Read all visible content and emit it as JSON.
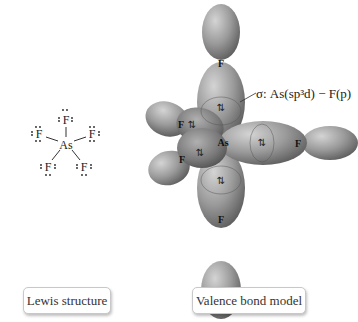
{
  "lewis": {
    "center_atom": "As",
    "ligands": [
      "F",
      "F",
      "F",
      "F",
      "F"
    ],
    "caption": "Lewis structure"
  },
  "valence_bond": {
    "center_atom": "As",
    "ligand_label": "F",
    "bond_annotation": "σ: As(sp³d) − F(p)",
    "electron_pair_symbol": "⇅",
    "caption": "Valence bond model",
    "colors": {
      "lobe_fill": "#8a8a8a",
      "lobe_highlight": "#c4c4c4",
      "lobe_dark": "#555555"
    }
  }
}
